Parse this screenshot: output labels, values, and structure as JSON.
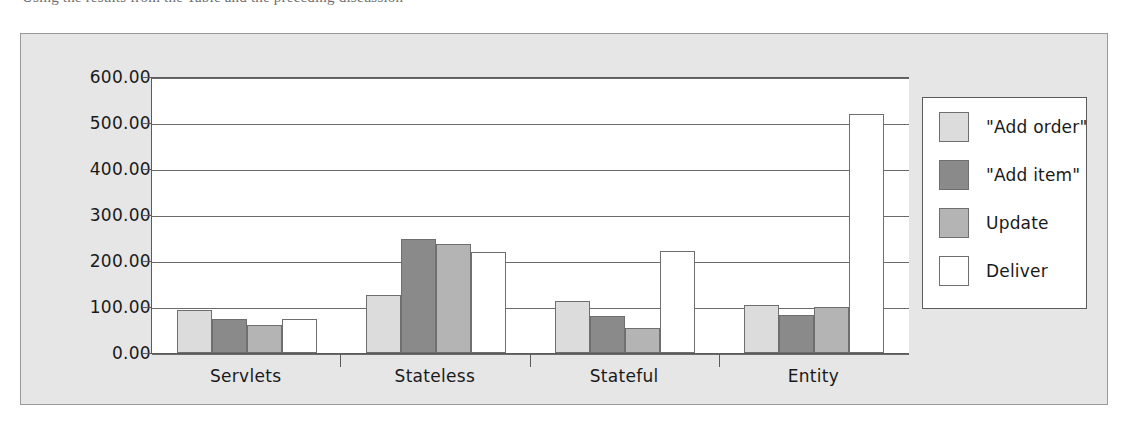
{
  "caption_fragment": "Using the results from the Table and the preceding discussion",
  "figure": {
    "background_color": "#e6e6e6",
    "plot_background_color": "#ffffff",
    "border_color": "#9a9a9a",
    "axis_color": "#5b5b5b"
  },
  "legend": {
    "position": "right",
    "entries": [
      {
        "label": "\"Add order\"",
        "color": "#dcdcdc"
      },
      {
        "label": "\"Add item\"",
        "color": "#8a8a8a"
      },
      {
        "label": "Update",
        "color": "#b4b4b4"
      },
      {
        "label": "Deliver",
        "color": "#ffffff"
      }
    ]
  },
  "chart_data": {
    "type": "bar",
    "title": "",
    "xlabel": "",
    "ylabel": "",
    "ylim": [
      0,
      600
    ],
    "ytick_interval": 100,
    "grid": true,
    "categories": [
      "Servlets",
      "Stateless",
      "Stateful",
      "Entity"
    ],
    "ytick_labels": [
      "0.00",
      "100.00",
      "200.00",
      "300.00",
      "400.00",
      "500.00",
      "600.00"
    ],
    "ytick_values": [
      0,
      100,
      200,
      300,
      400,
      500,
      600
    ],
    "series": [
      {
        "name": "\"Add order\"",
        "color": "#dcdcdc",
        "values": [
          93,
          126,
          113,
          105
        ]
      },
      {
        "name": "\"Add item\"",
        "color": "#8a8a8a",
        "values": [
          74,
          248,
          81,
          83
        ]
      },
      {
        "name": "Update",
        "color": "#b4b4b4",
        "values": [
          61,
          237,
          55,
          99
        ]
      },
      {
        "name": "Deliver",
        "color": "#ffffff",
        "values": [
          74,
          220,
          222,
          520
        ]
      }
    ]
  }
}
